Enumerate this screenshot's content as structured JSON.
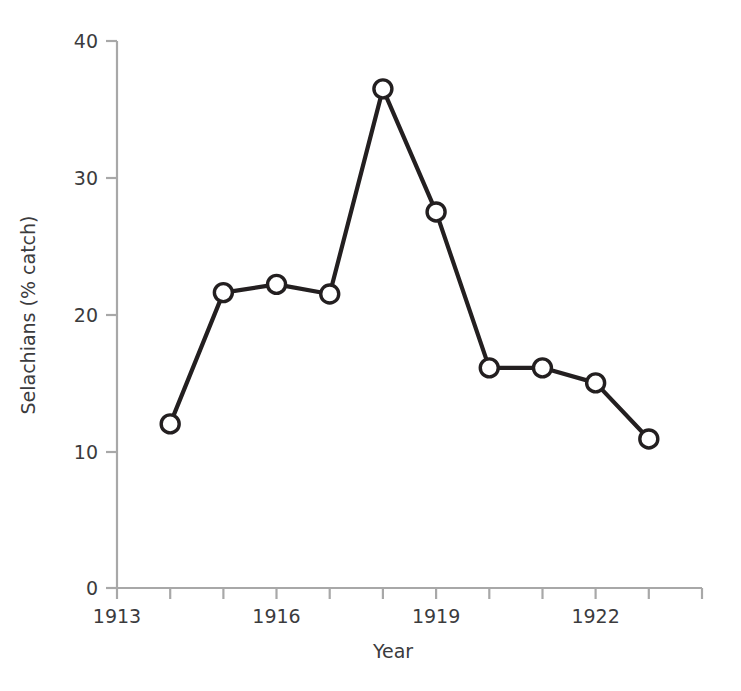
{
  "chart_data": {
    "type": "line",
    "title": "",
    "xlabel": "Year",
    "ylabel": "Selachians (% catch)",
    "x": [
      1914,
      1915,
      1916,
      1917,
      1918,
      1919,
      1920,
      1921,
      1922,
      1923
    ],
    "values": [
      12.0,
      21.6,
      22.2,
      21.5,
      36.5,
      27.5,
      16.1,
      16.1,
      15.0,
      10.9
    ],
    "series": [
      {
        "name": "Selachians",
        "x": [
          1914,
          1915,
          1916,
          1917,
          1918,
          1919,
          1920,
          1921,
          1922,
          1923
        ],
        "values": [
          12.0,
          21.6,
          22.2,
          21.5,
          36.5,
          27.5,
          16.1,
          16.1,
          15.0,
          10.9
        ]
      }
    ],
    "xlim": [
      1913,
      1924
    ],
    "ylim": [
      0,
      40
    ],
    "yticks": [
      0,
      10,
      20,
      30,
      40
    ],
    "ytick_labels": [
      "0",
      "10",
      "20",
      "30",
      "40"
    ],
    "xticks": [
      1913,
      1914,
      1915,
      1916,
      1917,
      1918,
      1919,
      1920,
      1921,
      1922,
      1923,
      1924
    ],
    "xtick_labels": [
      "1913",
      "",
      "",
      "1916",
      "",
      "",
      "1919",
      "",
      "",
      "1922",
      "",
      ""
    ],
    "xtick_labels_shown": [
      "1913",
      "1916",
      "1919",
      "1922"
    ],
    "grid": false,
    "legend": false,
    "legend_position": "none",
    "marker": "open-circle",
    "line_color": "#231f20",
    "marker_face_color": "#ffffff",
    "marker_edge_color": "#231f20",
    "axis_color": "#a8a8a8"
  },
  "axes": {
    "y_title": "Selachians (% catch)",
    "x_title": "Year",
    "y_tick_0": "0",
    "y_tick_10": "10",
    "y_tick_20": "20",
    "y_tick_30": "30",
    "y_tick_40": "40",
    "x_tick_1913": "1913",
    "x_tick_1916": "1916",
    "x_tick_1919": "1919",
    "x_tick_1922": "1922"
  }
}
